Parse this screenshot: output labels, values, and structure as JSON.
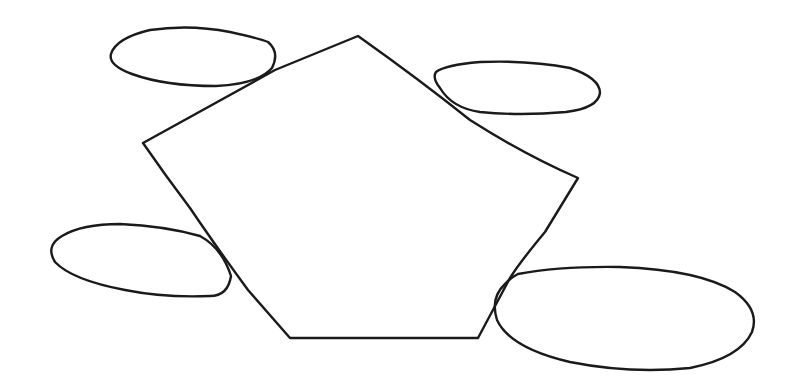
{
  "diagram": {
    "style": "hand-drawn sketch",
    "stroke_color": "#1a1a1a",
    "background": "#ffffff",
    "central_shape": {
      "type": "pentagon",
      "points": [
        [
          358,
          36
        ],
        [
          578,
          178
        ],
        [
          478,
          338
        ],
        [
          290,
          338
        ],
        [
          143,
          143
        ]
      ]
    },
    "satellites": [
      {
        "name": "top-left-ellipse",
        "cx": 192,
        "cy": 57,
        "rx": 84,
        "ry": 30
      },
      {
        "name": "top-right-ellipse",
        "cx": 518,
        "cy": 88,
        "rx": 84,
        "ry": 26
      },
      {
        "name": "bottom-left-ellipse",
        "cx": 140,
        "cy": 259,
        "rx": 91,
        "ry": 36
      },
      {
        "name": "bottom-right-ellipse",
        "cx": 624,
        "cy": 316,
        "rx": 131,
        "ry": 52
      }
    ],
    "labels": []
  }
}
